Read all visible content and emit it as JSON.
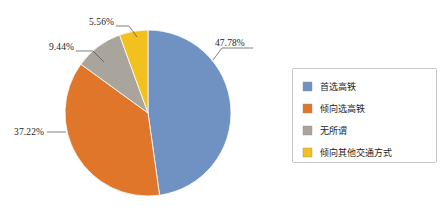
{
  "chart_data": {
    "type": "pie",
    "title": "",
    "subtitle": "",
    "xlabel": "",
    "ylabel": "",
    "legend_position": "right",
    "grid": false,
    "start_angle_deg": 0,
    "direction": "clockwise",
    "categories": [
      "首选高铁",
      "倾向选高铁",
      "无所谓",
      "倾向其他交通方式"
    ],
    "values": [
      47.78,
      37.22,
      9.44,
      5.56
    ],
    "labels": [
      "47.78%",
      "37.22%",
      "9.44%",
      "5.56%"
    ],
    "colors": [
      "#6f92c2",
      "#e0762a",
      "#a9a59c",
      "#f2c11f"
    ],
    "slices": [
      {
        "name": "首选高铁",
        "value": 47.78,
        "label": "47.78%",
        "color": "#6f92c2"
      },
      {
        "name": "倾向选高铁",
        "value": 37.22,
        "label": "37.22%",
        "color": "#e0762a"
      },
      {
        "name": "无所谓",
        "value": 9.44,
        "label": "9.44%",
        "color": "#a9a59c"
      },
      {
        "name": "倾向其他交通方式",
        "value": 5.56,
        "label": "5.56%",
        "color": "#f2c11f"
      }
    ]
  },
  "pie": {
    "center_x": 148,
    "center_y": 113,
    "radius": 83,
    "callouts": {
      "blue": "47.78%",
      "orange": "37.22%",
      "gray": "9.44%",
      "yellow": "5.56%"
    }
  },
  "legend": {
    "items": [
      {
        "label": "首选高铁",
        "color": "#6f92c2"
      },
      {
        "label": "倾向选高铁",
        "color": "#e0762a"
      },
      {
        "label": "无所谓",
        "color": "#a9a59c"
      },
      {
        "label": "倾向其他交通方式",
        "color": "#f2c11f"
      }
    ]
  }
}
